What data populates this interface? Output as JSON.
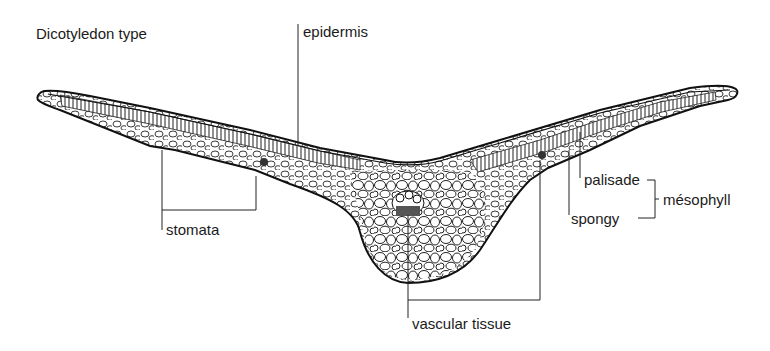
{
  "diagram": {
    "title": "Dicotyledon type",
    "labels": {
      "epidermis": "epidermis",
      "stomata": "stomata",
      "vascular_tissue": "vascular tissue",
      "palisade": "palisade",
      "spongy": "spongy",
      "mesophyll": "mésophyll"
    },
    "colors": {
      "ink": "#1b1b1b",
      "background": "#ffffff",
      "cell_fill": "#ffffff"
    }
  }
}
